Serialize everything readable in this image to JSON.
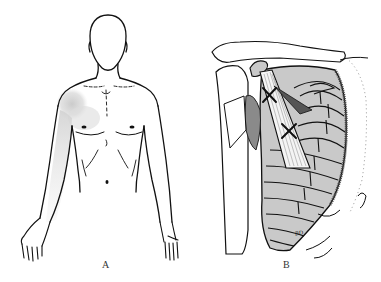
{
  "figure": {
    "panels": [
      {
        "id": "A",
        "label": "A",
        "subject": "anterior body outline with referred pain area",
        "shading_color": "#d4d4d4"
      },
      {
        "id": "B",
        "label": "B",
        "subject": "anterior ribcage with scapula and muscle, trigger points marked",
        "trigger_point_marker": "✕",
        "trigger_point_count": 2,
        "bone_fill": "#c8c8c8",
        "signature": "BD"
      }
    ],
    "colors": {
      "line": "#111111",
      "background": "#ffffff",
      "pain_shading": "#d4d4d4",
      "rib_fill": "#c9c9c9"
    }
  }
}
